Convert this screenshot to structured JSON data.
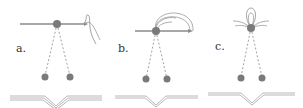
{
  "diagram": {
    "colors": {
      "bead": "#7a7a7a",
      "line": "#8a8a8a",
      "thread": "#9a9a9a",
      "label": "#333333",
      "base": "#b0b0b0"
    },
    "panels": [
      {
        "id": "a",
        "label": "a."
      },
      {
        "id": "b",
        "label": "b."
      },
      {
        "id": "c",
        "label": "c."
      }
    ]
  }
}
